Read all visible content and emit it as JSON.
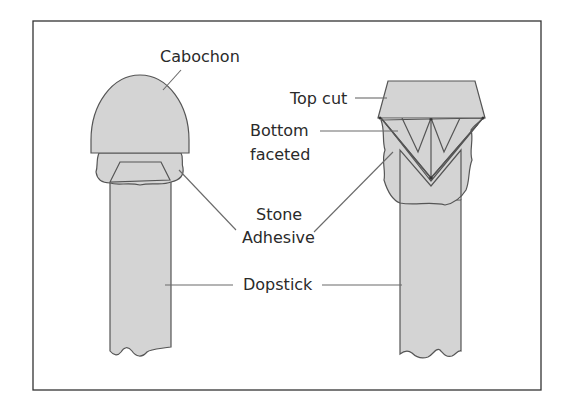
{
  "diagram": {
    "labels": {
      "cabochon": "Cabochon",
      "top_cut": "Top cut",
      "bottom_faceted_line1": "Bottom",
      "bottom_faceted_line2": "faceted",
      "stone_adhesive_line1": "Stone",
      "stone_adhesive_line2": "Adhesive",
      "dopstick": "Dopstick"
    },
    "colors": {
      "fill": "#d4d4d4",
      "outline": "#555555",
      "leader": "#6a6a6a",
      "frame": "#333333",
      "text": "#2a2a2a"
    }
  }
}
